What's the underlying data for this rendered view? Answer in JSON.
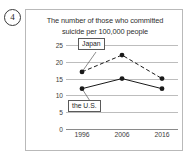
{
  "item": {
    "number": "4"
  },
  "chart_data": {
    "type": "line",
    "title": "The number of those who committed suicide per 100,000 people",
    "title_line1": "The number of those who committed",
    "title_line2": "suicide per 100,000 people",
    "xlabel": "",
    "ylabel": "",
    "categories": [
      "1996",
      "2006",
      "2016"
    ],
    "ylim": [
      0,
      25
    ],
    "yticks": [
      "0",
      "5",
      "10",
      "15",
      "20",
      "25"
    ],
    "grid": true,
    "legend_position": "inline-callout",
    "series": [
      {
        "name": "Japan",
        "values": [
          17,
          22,
          15
        ],
        "style": "dashed",
        "marker": "filled-circle",
        "color": "#1a1a1a"
      },
      {
        "name": "the U.S.",
        "values": [
          12,
          15,
          12
        ],
        "style": "solid",
        "marker": "filled-circle",
        "color": "#1a1a1a"
      }
    ],
    "annotations": [
      {
        "label": "Japan",
        "points_to_series": "Japan",
        "points_to_category": "1996"
      },
      {
        "label": "the U.S.",
        "points_to_series": "the U.S.",
        "points_to_category": "1996"
      }
    ]
  }
}
